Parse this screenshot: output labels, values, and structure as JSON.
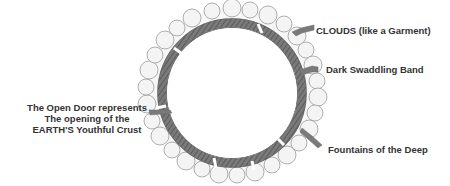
{
  "diagram": {
    "labels": {
      "clouds": "CLOUDS (like a Garment)",
      "band": "Dark Swaddling Band",
      "door_line1": "The Open Door represents",
      "door_line2": "The opening of the",
      "door_line3": "EARTH'S Youthful Crust",
      "fountains": "Fountains of the Deep"
    },
    "colors": {
      "band": "#6e6e6e",
      "cloud_outline": "#9a9a9a",
      "arrow": "#7a7a7a",
      "text": "#333333"
    }
  }
}
